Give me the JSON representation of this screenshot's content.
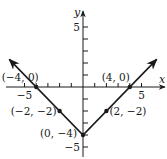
{
  "chart_data": {
    "type": "line",
    "title": "",
    "function": "y = |x| - 4",
    "xlabel": "x",
    "ylabel": "y",
    "xlim": [
      -6.5,
      7
    ],
    "ylim": [
      -5.8,
      6.3
    ],
    "grid": false,
    "legend": null,
    "x_tick_labels": [
      {
        "value": -5,
        "label": "−5"
      },
      {
        "value": 5,
        "label": "5"
      }
    ],
    "y_tick_labels": [
      {
        "value": 5,
        "label": "5"
      },
      {
        "value": -5,
        "label": "−5"
      }
    ],
    "x_ticks": [
      -5,
      -4,
      -3,
      -2,
      -1,
      1,
      2,
      3,
      4,
      5
    ],
    "y_ticks": [
      -5,
      -4,
      -3,
      -2,
      -1,
      1,
      2,
      3,
      4,
      5
    ],
    "series": [
      {
        "name": "y = |x| - 4",
        "x": [
          -6.3,
          0,
          6.3
        ],
        "y": [
          2.3,
          -4,
          2.3
        ],
        "arrows_at_ends": true,
        "color": "#1a1a1a"
      }
    ],
    "points": [
      {
        "x": -4,
        "y": 0,
        "label": "(−4, 0)"
      },
      {
        "x": 4,
        "y": 0,
        "label": "(4, 0)"
      },
      {
        "x": -2,
        "y": -2,
        "label": "(−2, −2)"
      },
      {
        "x": 2,
        "y": -2,
        "label": "(2, −2)"
      },
      {
        "x": 0,
        "y": -4,
        "label": "(0, −4)"
      }
    ]
  },
  "colors": {
    "ink": "#1a1a1a",
    "background": "#ffffff"
  }
}
